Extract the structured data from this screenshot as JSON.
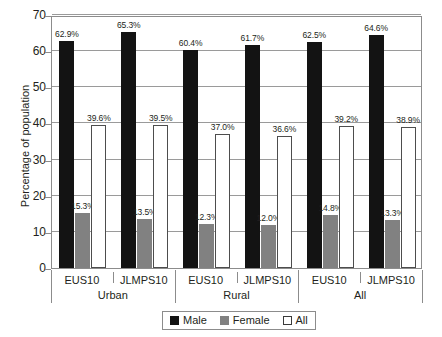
{
  "chart_data": {
    "type": "bar",
    "title": "",
    "xlabel": "",
    "ylabel": "Percentage of population",
    "ylim": [
      0,
      70
    ],
    "yticks": [
      0,
      10,
      20,
      30,
      40,
      50,
      60,
      70
    ],
    "grid": true,
    "legend_position": "bottom",
    "categories": [
      "EUS10",
      "JLMPS10",
      "EUS10",
      "JLMPS10",
      "EUS10",
      "JLMPS10"
    ],
    "groups": [
      {
        "label": "Urban",
        "categories": [
          "EUS10",
          "JLMPS10"
        ]
      },
      {
        "label": "Rural",
        "categories": [
          "EUS10",
          "JLMPS10"
        ]
      },
      {
        "label": "All",
        "categories": [
          "EUS10",
          "JLMPS10"
        ]
      }
    ],
    "series": [
      {
        "name": "Male",
        "color": "#131313",
        "values": [
          62.9,
          65.3,
          60.4,
          61.7,
          62.5,
          64.6
        ],
        "labels": [
          "62.9%",
          "65.3%",
          "60.4%",
          "61.7%",
          "62.5%",
          "64.6%"
        ]
      },
      {
        "name": "Female",
        "color": "#818181",
        "values": [
          15.3,
          13.5,
          12.3,
          12.0,
          14.8,
          13.3
        ],
        "labels": [
          "15.3%",
          "13.5%",
          "12.3%",
          "12.0%",
          "14.8%",
          "13.3%"
        ]
      },
      {
        "name": "All",
        "color": "#ffffff",
        "values": [
          39.6,
          39.5,
          37.0,
          36.6,
          39.2,
          38.9
        ],
        "labels": [
          "39.6%",
          "39.5%",
          "37.0%",
          "36.6%",
          "39.2%",
          "38.9%"
        ]
      }
    ]
  },
  "axis": {
    "y_title": "Percentage of population",
    "y_tick_labels": [
      "70",
      "60",
      "50",
      "40",
      "30",
      "20",
      "10",
      "0"
    ]
  },
  "legend": {
    "entries": [
      {
        "label": "Male",
        "swatch": "male"
      },
      {
        "label": "Female",
        "swatch": "female"
      },
      {
        "label": "All",
        "swatch": "all"
      }
    ]
  }
}
